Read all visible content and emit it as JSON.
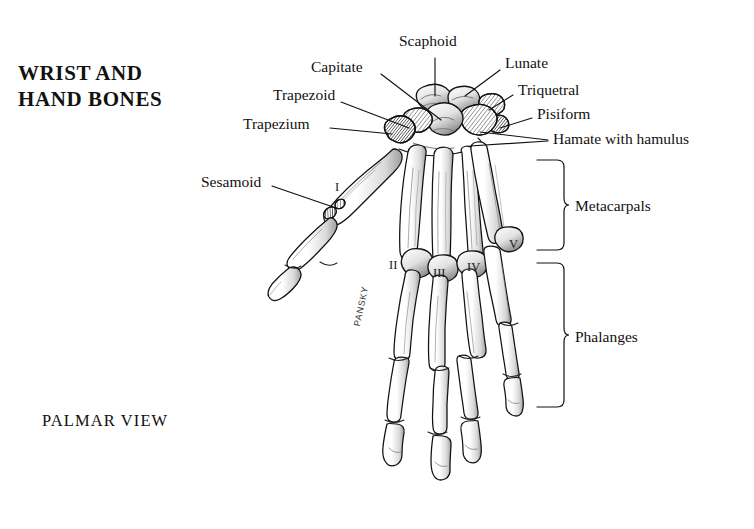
{
  "figure": {
    "title": "WRIST AND\nHAND BONES",
    "view_caption": "PALMAR VIEW",
    "artist_signature": "PANSKY",
    "background_color": "#ffffff",
    "ink_color": "#111111"
  },
  "callouts": [
    {
      "id": "scaphoid",
      "label": "Scaphoid"
    },
    {
      "id": "capitate",
      "label": "Capitate"
    },
    {
      "id": "trapezoid",
      "label": "Trapezoid"
    },
    {
      "id": "trapezium",
      "label": "Trapezium"
    },
    {
      "id": "sesamoid",
      "label": "Sesamoid"
    },
    {
      "id": "lunate",
      "label": "Lunate"
    },
    {
      "id": "triquetral",
      "label": "Triquetral"
    },
    {
      "id": "pisiform",
      "label": "Pisiform"
    },
    {
      "id": "hamate",
      "label": "Hamate with hamulus"
    }
  ],
  "brackets": [
    {
      "id": "metacarpals",
      "label": "Metacarpals"
    },
    {
      "id": "phalanges",
      "label": "Phalanges"
    }
  ],
  "ray_numerals": [
    {
      "id": "ray-1",
      "label": "I"
    },
    {
      "id": "ray-2",
      "label": "II"
    },
    {
      "id": "ray-3",
      "label": "III"
    },
    {
      "id": "ray-4",
      "label": "IV"
    },
    {
      "id": "ray-5",
      "label": "V"
    }
  ]
}
